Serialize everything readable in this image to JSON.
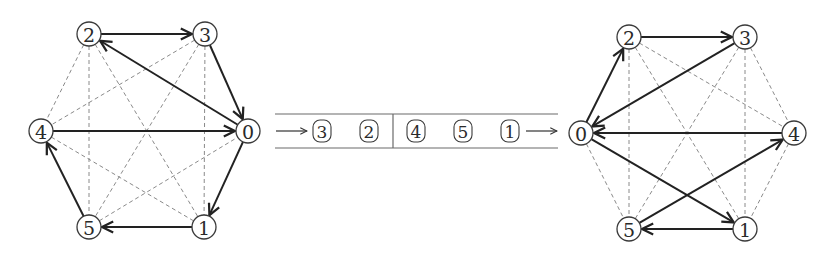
{
  "diagram": {
    "type": "graph-transformation",
    "left_graph": {
      "nodes": [
        {
          "id": "0",
          "label": "0",
          "x": 248,
          "y": 131
        },
        {
          "id": "1",
          "label": "1",
          "x": 204,
          "y": 227
        },
        {
          "id": "2",
          "label": "2",
          "x": 89,
          "y": 34
        },
        {
          "id": "3",
          "label": "3",
          "x": 205,
          "y": 34
        },
        {
          "id": "4",
          "label": "4",
          "x": 41,
          "y": 131
        },
        {
          "id": "5",
          "label": "5",
          "x": 89,
          "y": 227
        }
      ],
      "directed_edges": [
        {
          "from": "2",
          "to": "3"
        },
        {
          "from": "3",
          "to": "0"
        },
        {
          "from": "0",
          "to": "2"
        },
        {
          "from": "4",
          "to": "0"
        },
        {
          "from": "0",
          "to": "1"
        },
        {
          "from": "1",
          "to": "5"
        },
        {
          "from": "5",
          "to": "4"
        }
      ],
      "dashed_edges": [
        {
          "a": "2",
          "b": "4"
        },
        {
          "a": "2",
          "b": "5"
        },
        {
          "a": "2",
          "b": "1"
        },
        {
          "a": "3",
          "b": "4"
        },
        {
          "a": "3",
          "b": "5"
        },
        {
          "a": "3",
          "b": "1"
        },
        {
          "a": "4",
          "b": "1"
        },
        {
          "a": "5",
          "b": "0"
        }
      ]
    },
    "queue": {
      "items_left": [
        "3",
        "2"
      ],
      "items_right": [
        "4",
        "5",
        "1"
      ]
    },
    "right_graph": {
      "nodes": [
        {
          "id": "0",
          "label": "0",
          "x": 581,
          "y": 133
        },
        {
          "id": "1",
          "label": "1",
          "x": 745,
          "y": 229
        },
        {
          "id": "2",
          "label": "2",
          "x": 629,
          "y": 37
        },
        {
          "id": "3",
          "label": "3",
          "x": 745,
          "y": 37
        },
        {
          "id": "4",
          "label": "4",
          "x": 794,
          "y": 133
        },
        {
          "id": "5",
          "label": "5",
          "x": 629,
          "y": 229
        }
      ],
      "directed_edges": [
        {
          "from": "0",
          "to": "2"
        },
        {
          "from": "2",
          "to": "3"
        },
        {
          "from": "3",
          "to": "0"
        },
        {
          "from": "4",
          "to": "0"
        },
        {
          "from": "0",
          "to": "1"
        },
        {
          "from": "1",
          "to": "5"
        },
        {
          "from": "5",
          "to": "4"
        }
      ],
      "dashed_edges": [
        {
          "a": "2",
          "b": "5"
        },
        {
          "a": "2",
          "b": "1"
        },
        {
          "a": "2",
          "b": "4"
        },
        {
          "a": "3",
          "b": "5"
        },
        {
          "a": "3",
          "b": "1"
        },
        {
          "a": "3",
          "b": "4"
        },
        {
          "a": "0",
          "b": "5"
        },
        {
          "a": "4",
          "b": "1"
        }
      ]
    }
  }
}
